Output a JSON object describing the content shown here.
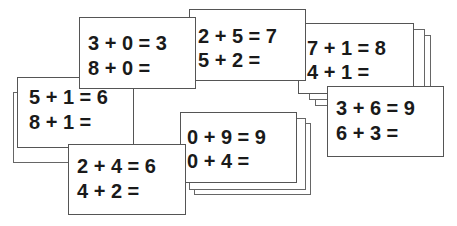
{
  "cards": [
    {
      "id": "card-3-0",
      "line1": "3 + 0 = 3",
      "line2": "8 + 0 ="
    },
    {
      "id": "card-2-5",
      "line1": "2 + 5 = 7",
      "line2": "5 + 2 ="
    },
    {
      "id": "card-7-1",
      "line1": "7 + 1 = 8",
      "line2": "4 + 1 ="
    },
    {
      "id": "card-5-1",
      "line1": "5 + 1 = 6",
      "line2": "8 + 1 ="
    },
    {
      "id": "card-3-6",
      "line1": "3 + 6 = 9",
      "line2": "6 + 3 ="
    },
    {
      "id": "card-0-9",
      "line1": "0 + 9 = 9",
      "line2": "0 + 4 ="
    },
    {
      "id": "card-2-4",
      "line1": "2 + 4 = 6",
      "line2": "4 + 2 ="
    }
  ]
}
